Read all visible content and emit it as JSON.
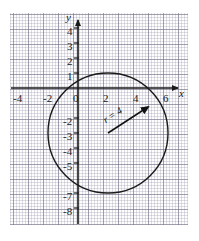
{
  "figure": {
    "background": "#ffffff",
    "grid_color": "#6e6e82",
    "axis_color": "#1a1a1a",
    "curve_color": "#1a1a1a"
  },
  "axes": {
    "x_letter": "x",
    "y_letter": "y",
    "x_label_name": "x-axis-label",
    "y_label_name": "y-axis-label"
  },
  "annotations": {
    "radius_label": "r = 4"
  },
  "chart_data": {
    "type": "scatter",
    "title": "",
    "xlabel": "x",
    "ylabel": "y",
    "xlim": [
      -5,
      7
    ],
    "ylim": [
      -9,
      5
    ],
    "grid": true,
    "legend": "none",
    "x_ticks": [
      -4,
      -2,
      0,
      2,
      4,
      6
    ],
    "x_tick_labels": [
      "-4",
      "-2",
      "0",
      "2",
      "4",
      "6"
    ],
    "y_ticks": [
      4,
      3,
      2,
      1,
      -2,
      -3,
      -4,
      -5,
      -7,
      -8
    ],
    "y_tick_labels": [
      "4",
      "3",
      "2",
      "1",
      "-2",
      "-3",
      "-4",
      "-5",
      "-7",
      "-8"
    ],
    "minor_grid_per_major": 5,
    "shapes": [
      {
        "kind": "circle",
        "center_x": 2,
        "center_y": -3,
        "radius": 4,
        "equation": "(x - 2)^2 + (y + 3)^2 = 16",
        "x_range": [
          -2,
          6
        ],
        "y_range": [
          -7,
          1
        ]
      },
      {
        "kind": "arrow",
        "label": "r = 4",
        "from_x": 2,
        "from_y": -3,
        "to_x": 4.83,
        "to_y": -1.17
      }
    ]
  },
  "tick_labels": {
    "x": [
      {
        "text": "-4",
        "left": 13,
        "top": 93
      },
      {
        "text": "-2",
        "left": 43,
        "top": 93
      },
      {
        "text": "0",
        "left": 73,
        "top": 93
      },
      {
        "text": "2",
        "left": 103,
        "top": 93
      },
      {
        "text": "4",
        "left": 133,
        "top": 93
      },
      {
        "text": "6",
        "left": 163,
        "top": 93
      }
    ],
    "y": [
      {
        "text": "4",
        "left": 67,
        "top": 26
      },
      {
        "text": "3",
        "left": 67,
        "top": 41
      },
      {
        "text": "2",
        "left": 67,
        "top": 56
      },
      {
        "text": "1",
        "left": 67,
        "top": 71
      },
      {
        "text": "-2",
        "left": 63,
        "top": 116
      },
      {
        "text": "-3",
        "left": 63,
        "top": 131
      },
      {
        "text": "-4",
        "left": 63,
        "top": 146
      },
      {
        "text": "-5",
        "left": 63,
        "top": 161
      },
      {
        "text": "-7",
        "left": 63,
        "top": 191
      },
      {
        "text": "-8",
        "left": 63,
        "top": 206
      }
    ]
  }
}
